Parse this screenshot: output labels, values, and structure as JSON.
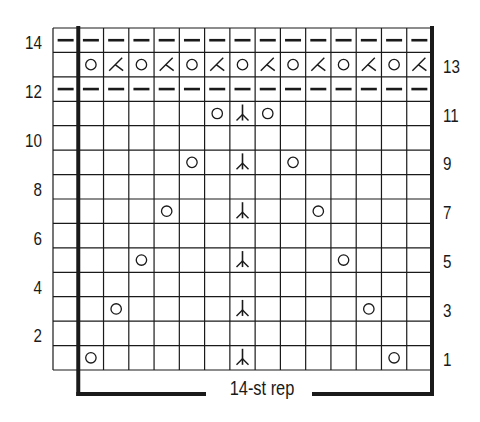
{
  "chart": {
    "type": "knitting-chart",
    "grid": {
      "columns": 15,
      "rows": 14,
      "rep_start_col": 1,
      "rep_end_col": 14
    },
    "colors": {
      "line": "#1a1a1a",
      "background": "#ffffff"
    },
    "left_row_labels": [
      {
        "row": 14,
        "label": "14"
      },
      {
        "row": 12,
        "label": "12"
      },
      {
        "row": 10,
        "label": "10"
      },
      {
        "row": 8,
        "label": "8"
      },
      {
        "row": 6,
        "label": "6"
      },
      {
        "row": 4,
        "label": "4"
      },
      {
        "row": 2,
        "label": "2"
      }
    ],
    "right_row_labels": [
      {
        "row": 13,
        "label": "13"
      },
      {
        "row": 11,
        "label": "11"
      },
      {
        "row": 9,
        "label": "9"
      },
      {
        "row": 7,
        "label": "7"
      },
      {
        "row": 5,
        "label": "5"
      },
      {
        "row": 3,
        "label": "3"
      },
      {
        "row": 1,
        "label": "1"
      }
    ],
    "rep_label": "14-st rep",
    "symbols": {
      "purl": "purl-dash",
      "yo": "yarn-over-circle",
      "k2tog": "k2tog-slant",
      "dbl_dec": "central-double-decrease"
    },
    "rows": [
      {
        "row": 1,
        "cells": {
          "1": "yo",
          "7": "dbl_dec",
          "13": "yo"
        }
      },
      {
        "row": 2,
        "cells": {}
      },
      {
        "row": 3,
        "cells": {
          "2": "yo",
          "7": "dbl_dec",
          "12": "yo"
        }
      },
      {
        "row": 4,
        "cells": {}
      },
      {
        "row": 5,
        "cells": {
          "3": "yo",
          "7": "dbl_dec",
          "11": "yo"
        }
      },
      {
        "row": 6,
        "cells": {}
      },
      {
        "row": 7,
        "cells": {
          "4": "yo",
          "7": "dbl_dec",
          "10": "yo"
        }
      },
      {
        "row": 8,
        "cells": {}
      },
      {
        "row": 9,
        "cells": {
          "5": "yo",
          "7": "dbl_dec",
          "9": "yo"
        }
      },
      {
        "row": 10,
        "cells": {}
      },
      {
        "row": 11,
        "cells": {
          "6": "yo",
          "7": "dbl_dec",
          "8": "yo"
        }
      },
      {
        "row": 12,
        "cells": {
          "0": "purl",
          "1": "purl",
          "2": "purl",
          "3": "purl",
          "4": "purl",
          "5": "purl",
          "6": "purl",
          "7": "purl",
          "8": "purl",
          "9": "purl",
          "10": "purl",
          "11": "purl",
          "12": "purl",
          "13": "purl",
          "14": "purl"
        }
      },
      {
        "row": 13,
        "cells": {
          "1": "yo",
          "2": "k2tog",
          "3": "yo",
          "4": "k2tog",
          "5": "yo",
          "6": "k2tog",
          "7": "yo",
          "8": "k2tog",
          "9": "yo",
          "10": "k2tog",
          "11": "yo",
          "12": "k2tog",
          "13": "yo",
          "14": "k2tog"
        }
      },
      {
        "row": 14,
        "cells": {
          "0": "purl",
          "1": "purl",
          "2": "purl",
          "3": "purl",
          "4": "purl",
          "5": "purl",
          "6": "purl",
          "7": "purl",
          "8": "purl",
          "9": "purl",
          "10": "purl",
          "11": "purl",
          "12": "purl",
          "13": "purl",
          "14": "purl"
        }
      }
    ]
  }
}
